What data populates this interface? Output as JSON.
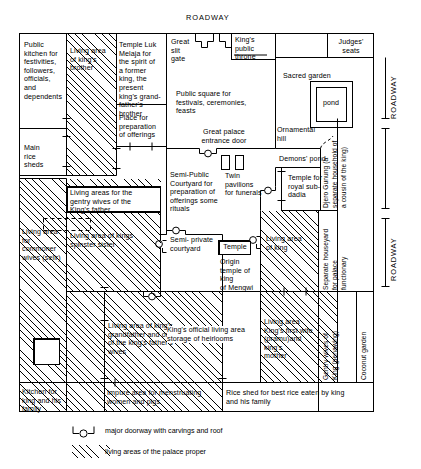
{
  "roadway_labels": {
    "top": "ROADWAY",
    "right_upper": "ROADWAY",
    "right_lower": "ROADWAY"
  },
  "rooms": {
    "public_kitchen": "Public\nkitchen for\nfestivities,\nfollowers,\nofficials,\nand\ndependents",
    "living_kings_brother": "Living area\nof king's\nbrother",
    "temple_luk_melaja": "Temple Luk\nMelaja for\nthe spirit of\na former\nking, the\npresent\nking's grand-\nfather's\nbrother",
    "place_offerings": "Place for\npreparation\nof offerings",
    "main_rice_sheds": "Main\nrice\nsheds",
    "great_slit_gate": "Great\nslit\ngate",
    "kings_public_throne": "King's\npublic\nthrone",
    "judges_seats": "Judges'\nseats",
    "sacred_garden": "Sacred garden",
    "pond": "pond",
    "public_square": "Public square for\nfestivals, ceremonies,\nfeasts",
    "great_palace_entrance_door": "Great palace\nentrance door",
    "ornamental_hill": "Ornamental\nhill",
    "demons_pond": "Demons' pond",
    "semi_public_courtyard": "Semi-Public\nCourtyard for\npreparation of\nofferings some\nrituals",
    "twin_pavilions": "Twin\npavilions\nfor funerals",
    "temple_royal_subdadia": "Temple for\nroyal sub-\ndadia",
    "living_gentry_wives_kings_father": "Living areas for the\ngentry wives of the\nKing's father",
    "living_kings_spinster_sister": "Living area of kings\nspinster sister",
    "living_commoner_wives": "Living area\nfor\ncommoner\nwives (selir)",
    "semi_private_courtyard": "Semi- private\ncourtyard",
    "temple_box": "Temple",
    "origin_temple_mengwi": "Origin\ntemple of\nking\nof Mengwi",
    "living_area_of_king": "Living area\nof king",
    "living_kings_grandfather": "Living area of king's\ngrandfather and one\nof the king's father's\nwives",
    "kings_official_living_area": "King's official living area\nstorage of heirlooms",
    "living_kings_first_wife": "Living area\nKing's first wife\n(pramu)and king's\nmother",
    "kitchen_king_family": "Kitchen for\nking and his\nfamily",
    "impure_area": "Impure area for menstruating\nwomen and pigs",
    "rice_shed_best_rice": "Rice shed for best rice eaten by king\nand his family"
  },
  "vertical_labels": {
    "djero_gunung": "Djero Gunung (a\nseparate household of\na cousin of the king)",
    "djero_gunung_line1": "Djero Gunung (a",
    "djero_gunung_line2": "separate household of",
    "djero_gunung_line3": "a cousin of the king)",
    "separate_houseyard_line1": "Separate houseyard",
    "separate_houseyard_line2": "for palace",
    "separate_houseyard_line3": "functionary",
    "gentry_wives_line1": "Gentry wives of",
    "gentry_wives_line2": "King (penawing)",
    "coconut_garden": "Coconut garden"
  },
  "legend": {
    "doorway": "major doorway with carvings and roof",
    "living_areas": "living areas of the palace proper"
  },
  "colors": {
    "line": "#000000",
    "background": "#ffffff"
  }
}
